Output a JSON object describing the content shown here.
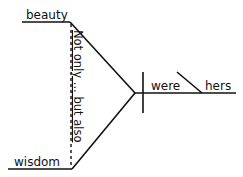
{
  "diagram": {
    "type": "sentence-diagram",
    "subjects": [
      {
        "word": "beauty"
      },
      {
        "word": "wisdom"
      }
    ],
    "correlative_conjunction": {
      "label_parts": [
        "Not only",
        "...",
        "but also"
      ],
      "full_text": "Not only ... but also"
    },
    "verb": {
      "word": "were"
    },
    "predicate_complement": {
      "word": "hers"
    },
    "line_color": "#111111"
  }
}
